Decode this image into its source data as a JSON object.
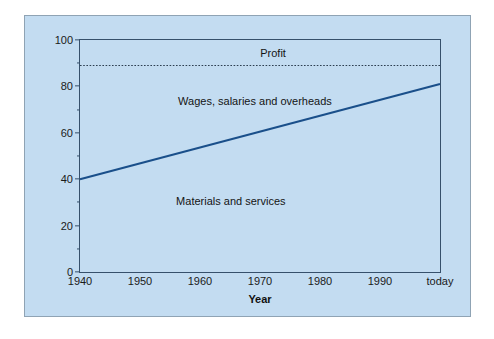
{
  "chart_data": {
    "type": "line",
    "title": "",
    "xlabel": "Year",
    "ylabel": "Disposal of revenue (%)",
    "xlim": [
      1940,
      2000
    ],
    "ylim": [
      0,
      100
    ],
    "grid": false,
    "legend": "none",
    "x_tick_labels": [
      "1940",
      "1950",
      "1960",
      "1970",
      "1980",
      "1990",
      "today"
    ],
    "x_tick_values": [
      1940,
      1950,
      1960,
      1970,
      1980,
      1990,
      2000
    ],
    "y_tick_labels": [
      "0",
      "20",
      "40",
      "60",
      "80",
      "100"
    ],
    "y_tick_values": [
      0,
      20,
      40,
      60,
      80,
      100
    ],
    "y_minor_ticks": [
      10,
      30,
      50,
      70,
      90
    ],
    "series": [
      {
        "name": "Materials and services boundary",
        "style": "solid",
        "color": "#1a4f8a",
        "x": [
          1940,
          2000
        ],
        "values": [
          40,
          81
        ]
      },
      {
        "name": "Profit boundary",
        "style": "dotted",
        "color": "#2c3e50",
        "x": [
          1940,
          2000
        ],
        "values": [
          89,
          89
        ]
      }
    ],
    "annotations": [
      {
        "text": "Profit",
        "x": 1972,
        "y": 94.5
      },
      {
        "text": "Wages, salaries and overheads",
        "x": 1969,
        "y": 74
      },
      {
        "text": "Materials and services",
        "x": 1965,
        "y": 31
      }
    ]
  },
  "colors": {
    "panel_background": "#c3dcf1",
    "page_background": "#ffffff",
    "axis": "#36506b",
    "line": "#1a4f8a",
    "dotted_line": "#2c3e50",
    "text": "#141414",
    "frame_border": "#8fa3b4"
  }
}
